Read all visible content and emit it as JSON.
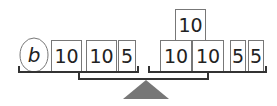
{
  "diagram": {
    "type": "balance-scale",
    "left_pan": {
      "items": [
        {
          "kind": "variable",
          "label": "b"
        },
        {
          "kind": "weight",
          "label": "10"
        },
        {
          "kind": "weight",
          "label": "10"
        },
        {
          "kind": "weight",
          "label": "5"
        }
      ]
    },
    "right_pan": {
      "items": [
        {
          "kind": "weight",
          "label": "10",
          "stacked": true
        },
        {
          "kind": "weight",
          "label": "10"
        },
        {
          "kind": "weight",
          "label": "10"
        },
        {
          "kind": "weight",
          "label": "5"
        },
        {
          "kind": "weight",
          "label": "5"
        }
      ]
    },
    "colors": {
      "fulcrum": "#777777",
      "lines": "#333333",
      "box_border": "#777777"
    }
  }
}
